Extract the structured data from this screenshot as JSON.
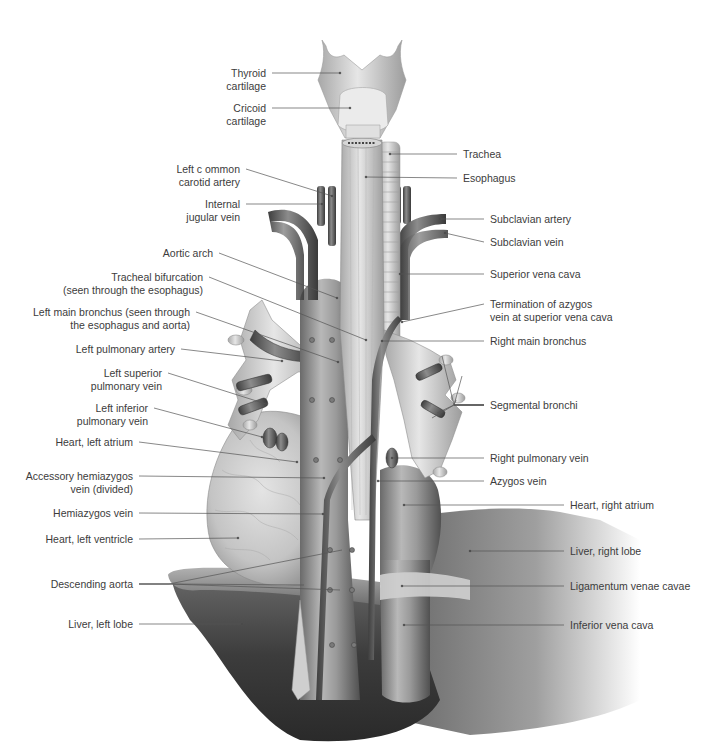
{
  "figure": {
    "colors": {
      "background": "#ffffff",
      "tissue_light": "#d9d9d9",
      "tissue_mid": "#9a9a9a",
      "tissue_dark": "#4a4a4a",
      "leader_line": "#555555",
      "label_text": "#3c3c3c"
    }
  },
  "labels_left": [
    {
      "id": "thyroid-cartilage",
      "lines": [
        "Thyroid",
        "cartilage"
      ],
      "x": 266,
      "y": 67,
      "target": [
        340,
        73
      ]
    },
    {
      "id": "cricoid-cartilage",
      "lines": [
        "Cricoid",
        "cartilage"
      ],
      "x": 266,
      "y": 102,
      "target": [
        350,
        108
      ]
    },
    {
      "id": "left-common-carotid-artery",
      "lines": [
        "Left c ommon",
        "carotid artery"
      ],
      "x": 240,
      "y": 163,
      "target": [
        332,
        196
      ]
    },
    {
      "id": "internal-jugular-vein",
      "lines": [
        "Internal",
        "jugular vein"
      ],
      "x": 240,
      "y": 198,
      "target": [
        322,
        204
      ]
    },
    {
      "id": "aortic-arch",
      "lines": [
        "Aortic arch"
      ],
      "x": 213,
      "y": 247,
      "target": [
        337,
        298
      ]
    },
    {
      "id": "tracheal-bifurcation",
      "lines": [
        "Tracheal bifurcation",
        "(seen through the esophagus)"
      ],
      "x": 203,
      "y": 271,
      "target": [
        366,
        340
      ]
    },
    {
      "id": "left-main-bronchus",
      "lines": [
        "Left main bronchus (seen through",
        "the esophagus and aorta)"
      ],
      "x": 190,
      "y": 306,
      "target": [
        338,
        362
      ]
    },
    {
      "id": "left-pulmonary-artery",
      "lines": [
        "Left pulmonary artery"
      ],
      "x": 175,
      "y": 343,
      "target": [
        282,
        361
      ]
    },
    {
      "id": "left-superior-pulmonary-vein",
      "lines": [
        "Left superior",
        "pulmonary vein"
      ],
      "x": 162,
      "y": 367,
      "target": [
        266,
        404
      ]
    },
    {
      "id": "left-inferior-pulmonary-vein",
      "lines": [
        "Left inferior",
        "pulmonary vein"
      ],
      "x": 148,
      "y": 402,
      "target": [
        262,
        437
      ]
    },
    {
      "id": "heart-left-atrium",
      "lines": [
        "Heart, left atrium"
      ],
      "x": 133,
      "y": 436,
      "target": [
        297,
        462
      ]
    },
    {
      "id": "accessory-hemiazygos-vein",
      "lines": [
        "Accessory hemiazygos",
        "vein (divided)"
      ],
      "x": 133,
      "y": 470,
      "target": [
        324,
        478
      ]
    },
    {
      "id": "hemiazygos-vein",
      "lines": [
        "Hemiazygos vein"
      ],
      "x": 133,
      "y": 507,
      "target": [
        323,
        514
      ]
    },
    {
      "id": "heart-left-ventricle",
      "lines": [
        "Heart, left ventricle"
      ],
      "x": 133,
      "y": 533,
      "target": [
        238,
        538
      ]
    },
    {
      "id": "descending-aorta",
      "lines": [
        "Descending aorta"
      ],
      "x": 133,
      "y": 578,
      "targets": [
        [
          304,
          585
        ],
        [
          342,
          550
        ],
        [
          340,
          590
        ]
      ]
    },
    {
      "id": "liver-left-lobe",
      "lines": [
        "Liver, left lobe"
      ],
      "x": 133,
      "y": 618,
      "target": [
        242,
        624
      ]
    }
  ],
  "labels_right": [
    {
      "id": "trachea",
      "lines": [
        "Trachea"
      ],
      "x": 463,
      "y": 148,
      "target": [
        390,
        154
      ]
    },
    {
      "id": "esophagus",
      "lines": [
        "Esophagus"
      ],
      "x": 463,
      "y": 172,
      "target": [
        366,
        177
      ]
    },
    {
      "id": "subclavian-artery",
      "lines": [
        "Subclavian artery"
      ],
      "x": 490,
      "y": 213,
      "target": [
        440,
        219
      ]
    },
    {
      "id": "subclavian-vein",
      "lines": [
        "Subclavian vein"
      ],
      "x": 490,
      "y": 236,
      "target": [
        445,
        233
      ]
    },
    {
      "id": "superior-vena-cava",
      "lines": [
        "Superior vena cava"
      ],
      "x": 490,
      "y": 268,
      "target": [
        400,
        274
      ]
    },
    {
      "id": "termination-of-azygos-vein",
      "lines": [
        "Termination of azygos",
        "vein at superior vena cava"
      ],
      "x": 490,
      "y": 298,
      "target": [
        402,
        322
      ]
    },
    {
      "id": "right-main-bronchus",
      "lines": [
        "Right main bronchus"
      ],
      "x": 490,
      "y": 335,
      "target": [
        382,
        341
      ]
    },
    {
      "id": "segmental-bronchi",
      "lines": [
        "Segmental bronchi"
      ],
      "x": 490,
      "y": 399,
      "targets": [
        [
          442,
          356
        ],
        [
          462,
          376
        ],
        [
          432,
          418
        ],
        [
          437,
          413
        ],
        [
          456,
          400
        ]
      ]
    },
    {
      "id": "right-pulmonary-vein",
      "lines": [
        "Right pulmonary vein"
      ],
      "x": 490,
      "y": 452,
      "target": [
        392,
        458
      ]
    },
    {
      "id": "azygos-vein",
      "lines": [
        "Azygos vein"
      ],
      "x": 490,
      "y": 475,
      "target": [
        378,
        481
      ]
    },
    {
      "id": "heart-right-atrium",
      "lines": [
        "Heart, right atrium"
      ],
      "x": 570,
      "y": 499,
      "target": [
        404,
        505
      ]
    },
    {
      "id": "liver-right-lobe",
      "lines": [
        "Liver, right lobe"
      ],
      "x": 570,
      "y": 545,
      "target": [
        470,
        551
      ]
    },
    {
      "id": "ligamentum-venae-cavae",
      "lines": [
        "Ligamentum venae cavae"
      ],
      "x": 570,
      "y": 580,
      "target": [
        402,
        586
      ]
    },
    {
      "id": "inferior-vena-cava",
      "lines": [
        "Inferior vena cava"
      ],
      "x": 570,
      "y": 619,
      "target": [
        404,
        625
      ]
    }
  ]
}
